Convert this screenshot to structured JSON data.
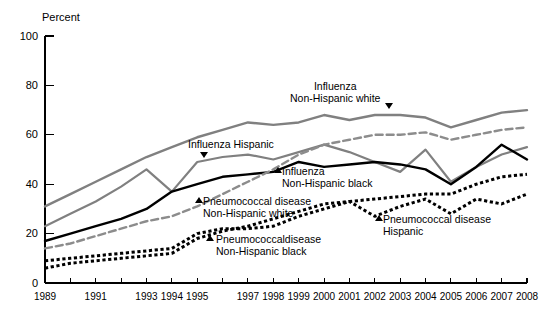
{
  "chart_data": {
    "type": "line",
    "title": "",
    "xlabel": "",
    "ylabel": "Percent",
    "ylim": [
      0,
      100
    ],
    "yticks": [
      0,
      20,
      40,
      60,
      80,
      100
    ],
    "ytick_labels": [
      "0",
      "20",
      "40",
      "60",
      "80",
      "100"
    ],
    "grid": false,
    "legend_position": "inline-annotations",
    "x": [
      1989,
      1990,
      1991,
      1992,
      1993,
      1994,
      1995,
      1996,
      1997,
      1998,
      1999,
      2000,
      2001,
      2002,
      2003,
      2004,
      2005,
      2006,
      2007,
      2008
    ],
    "xtick_labels": [
      "1989",
      "",
      "1991",
      "",
      "1993",
      "1994",
      "1995",
      "",
      "1997",
      "1998",
      "1999",
      "2000",
      "2001",
      "2002",
      "2003",
      "2004",
      "2005",
      "2006",
      "2007",
      "2008"
    ],
    "series": [
      {
        "name": "Influenza Non-Hispanic white",
        "style": "solid",
        "color": "#808080",
        "width": 2.4,
        "values": [
          31,
          36,
          41,
          46,
          51,
          55,
          59,
          62,
          65,
          64,
          65,
          68,
          66,
          68,
          68,
          67,
          63,
          66,
          69,
          70
        ]
      },
      {
        "name": "Influenza Hispanic",
        "style": "solid",
        "color": "#808080",
        "width": 2.2,
        "values": [
          23,
          28,
          33,
          39,
          46,
          37,
          49,
          51,
          52,
          50,
          53,
          56,
          53,
          49,
          45,
          54,
          41,
          47,
          52,
          55
        ]
      },
      {
        "name": "Influenza Non-Hispanic black",
        "style": "solid",
        "color": "#000000",
        "width": 2.4,
        "values": [
          17,
          20,
          23,
          26,
          30,
          37,
          40,
          43,
          44,
          45,
          49,
          47,
          48,
          49,
          48,
          46,
          40,
          47,
          56,
          50
        ]
      },
      {
        "name": "Pneumococcal disease Non-Hispanic white",
        "style": "dashed",
        "color": "#8c8c8c",
        "width": 2.4,
        "values": [
          14,
          16,
          19,
          22,
          25,
          27,
          31,
          36,
          41,
          46,
          52,
          56,
          58,
          60,
          60,
          61,
          58,
          60,
          62,
          63
        ]
      },
      {
        "name": "Pneumococcal disease Non-Hispanic black",
        "style": "dotted",
        "color": "#000000",
        "width": 3.0,
        "values": [
          9,
          10,
          11,
          12,
          13,
          14,
          20,
          22,
          22,
          23,
          27,
          30,
          33,
          34,
          35,
          36,
          36,
          40,
          43,
          44
        ]
      },
      {
        "name": "Pneumococcal disease Hispanic",
        "style": "dotted",
        "color": "#000000",
        "width": 3.0,
        "values": [
          6,
          8,
          9,
          10,
          11,
          12,
          18,
          21,
          23,
          26,
          29,
          32,
          33,
          27,
          31,
          34,
          28,
          34,
          32,
          36
        ]
      }
    ],
    "annotations": [
      {
        "id": "influenza-nhw",
        "lines": [
          "Influenza",
          "Non-Hispanic white"
        ],
        "marker": "down"
      },
      {
        "id": "influenza-hispanic",
        "lines": [
          "Influenza Hispanic"
        ],
        "marker": "down"
      },
      {
        "id": "influenza-nhb",
        "lines": [
          "Influenza",
          "Non-Hispanic black"
        ],
        "marker": "up"
      },
      {
        "id": "pneumococcal-nhw",
        "lines": [
          "Pneumococcal disease",
          "Non-Hispanic white"
        ],
        "marker": "up"
      },
      {
        "id": "pneumococcal-nhb",
        "lines": [
          "Pneumococcaldisease",
          "Non-Hispanic black"
        ],
        "marker": "up"
      },
      {
        "id": "pneumococcal-hispanic",
        "lines": [
          "Pneumococcal disease",
          "Hispanic"
        ],
        "marker": "up"
      }
    ]
  },
  "axis": {
    "unit_label": "Percent"
  }
}
